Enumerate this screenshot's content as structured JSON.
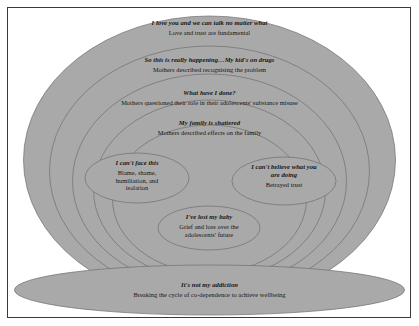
{
  "figure": {
    "colors": {
      "ellipse_fill": "#a9a9a9",
      "ellipse_stroke": "#6e6e6e",
      "frame_border": "#3a3a3a",
      "background": "#ffffff",
      "text": "#141414"
    }
  },
  "layers": [
    {
      "id": "layer-1-love-trust",
      "theme": "I love you and we can talk no matter what",
      "description": "Love and trust are fundamental"
    },
    {
      "id": "layer-2-recognising",
      "theme": "So this is really happening…My kid's on drugs",
      "description": "Mothers described recognising the problem"
    },
    {
      "id": "layer-3-what-have-i-done",
      "theme": "What have I done?",
      "description": "Mothers questioned their role in their adolescents' substance misuse"
    },
    {
      "id": "layer-4-family-shattered",
      "theme": "My family is shattered",
      "description": "Mothers described effects on the family"
    }
  ],
  "inner_ellipses": [
    {
      "id": "inner-left-cant-face-this",
      "theme": "I can't face this",
      "description": "Blame, shame, humiliation, and isolation"
    },
    {
      "id": "inner-right-cant-believe",
      "theme": "I can't believe what you are doing",
      "description": "Betrayed trust"
    },
    {
      "id": "inner-center-lost-my-baby",
      "theme": "I've lost my baby",
      "description": "Grief and loss over the adolescents' future"
    }
  ],
  "base_ellipse": {
    "id": "base-not-my-addiction",
    "theme": "It's not my addiction",
    "description": "Breaking the cycle of co-dependence to achieve wellbeing"
  }
}
